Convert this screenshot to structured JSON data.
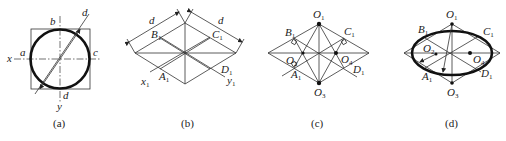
{
  "figure": {
    "panels": [
      {
        "id": "a",
        "caption": "(a)",
        "labels": {
          "b": "b",
          "d_top": "d",
          "a": "a",
          "c": "c",
          "x": "x",
          "d_bottom": "d",
          "y": "y"
        }
      },
      {
        "id": "b",
        "caption": "(b)",
        "labels": {
          "d_left": "d",
          "d_right": "d",
          "B1": "B",
          "C1": "C",
          "A1": "A",
          "D1": "D",
          "x1": "x",
          "y1": "y",
          "sub": "1"
        }
      },
      {
        "id": "c",
        "caption": "(c)",
        "labels": {
          "O1": "O",
          "O2": "O",
          "O3": "O",
          "O4": "O",
          "B1": "B",
          "C1": "C",
          "A1": "A",
          "D1": "D",
          "sub1": "1",
          "sub2": "2",
          "sub3": "3",
          "sub4": "4"
        }
      },
      {
        "id": "d",
        "caption": "(d)",
        "labels": {
          "O1": "O",
          "O2": "O",
          "O3": "O",
          "O4": "O",
          "B1": "B",
          "C1": "C",
          "A1": "A",
          "D1": "D",
          "sub1": "1",
          "sub2": "2",
          "sub3": "3",
          "sub4": "4"
        }
      }
    ],
    "colors": {
      "line": "#333333",
      "thick": "#111111",
      "background": "#ffffff"
    }
  }
}
